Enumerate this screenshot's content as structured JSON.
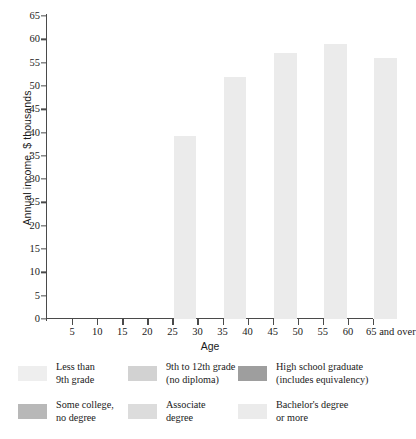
{
  "chart_data": {
    "type": "bar",
    "subtype": "stacked-bar",
    "title": "",
    "xlabel": "Age",
    "ylabel": "Annual income, $ thousands",
    "xlim": [
      0,
      65
    ],
    "ylim": [
      0,
      65
    ],
    "grid": false,
    "xticks": [
      "5",
      "10",
      "15",
      "20",
      "25",
      "30",
      "35",
      "40",
      "45",
      "50",
      "55",
      "60",
      "65 and over"
    ],
    "xtick_values": [
      5,
      10,
      15,
      20,
      25,
      30,
      35,
      40,
      45,
      50,
      55,
      60,
      65
    ],
    "yticks": [
      "0",
      "5",
      "10",
      "15",
      "20",
      "25",
      "30",
      "35",
      "40",
      "45",
      "50",
      "55",
      "60",
      "65"
    ],
    "ytick_values": [
      0,
      5,
      10,
      15,
      20,
      25,
      30,
      35,
      40,
      45,
      50,
      55,
      60,
      65
    ],
    "categories": [
      "25 to 34",
      "35 to 44",
      "45 to 54",
      "55 to 64",
      "65 and over"
    ],
    "category_spans": [
      [
        25,
        30
      ],
      [
        35,
        40
      ],
      [
        45,
        50
      ],
      [
        55,
        60
      ],
      [
        65,
        70
      ]
    ],
    "series": [
      {
        "name": "Less than 9th grade",
        "color": "#eeeeee",
        "values": [
          16.0,
          20.0,
          21.2,
          22.0,
          16.5
        ]
      },
      {
        "name": "9th to 12th grade (no diploma)",
        "color": "#d2d2d2",
        "values": [
          19.7,
          24.0,
          25.7,
          29.3,
          19.0
        ]
      },
      {
        "name": "High school graduate (includes equivalency)",
        "color": "#9e9e9e",
        "values": [
          24.0,
          26.7,
          32.3,
          32.7,
          27.0
        ]
      },
      {
        "name": "Some college, no degree",
        "color": "#b8b8b8",
        "values": [
          27.6,
          29.5,
          40.7,
          33.0,
          30.3
        ]
      },
      {
        "name": "Associate degree",
        "color": "#dcdcdc",
        "values": [
          28.5,
          33.3,
          41.0,
          34.7,
          30.3
        ]
      },
      {
        "name": "Bachelor's degree or more",
        "color": "#ebebeb",
        "values": [
          39.3,
          52.0,
          57.0,
          59.0,
          56.0
        ]
      }
    ],
    "cumulative_tops": {
      "note": "series values are cumulative stack tops in $ thousands",
      "bar_totals": [
        39.3,
        52.0,
        57.0,
        59.0,
        56.0
      ]
    }
  },
  "legend": {
    "position": "below",
    "items": [
      {
        "label_line1": "Less than",
        "label_line2": "9th grade",
        "color": "#eeeeee"
      },
      {
        "label_line1": "9th to 12th grade",
        "label_line2": "(no diploma)",
        "color": "#d2d2d2"
      },
      {
        "label_line1": "High school graduate",
        "label_line2": "(includes equivalency)",
        "color": "#9e9e9e"
      },
      {
        "label_line1": "Some college,",
        "label_line2": "no degree",
        "color": "#b8b8b8"
      },
      {
        "label_line1": "Associate",
        "label_line2": "degree",
        "color": "#dcdcdc"
      },
      {
        "label_line1": "Bachelor's degree",
        "label_line2": "or more",
        "color": "#ebebeb"
      }
    ]
  }
}
